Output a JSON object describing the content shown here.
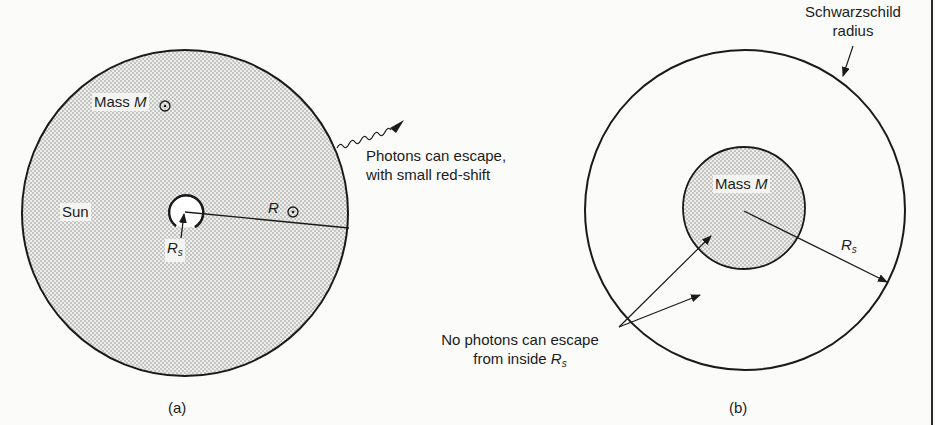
{
  "panel_a": {
    "caption": "(a)",
    "sun_label": "Sun",
    "mass_label": "Mass",
    "mass_symbol": "M",
    "radius_label": "R",
    "schwarzschild_label": "R",
    "schwarzschild_sub": "s",
    "photon_text_line1": "Photons can escape,",
    "photon_text_line2": "with small red-shift"
  },
  "panel_b": {
    "caption": "(b)",
    "mass_label": "Mass",
    "mass_symbol": "M",
    "radius_label": "R",
    "radius_sub": "s",
    "schwarzschild_line1": "Schwarzschild",
    "schwarzschild_line2": "radius",
    "no_escape_line1": "No photons can escape",
    "no_escape_line2_prefix": "from inside",
    "no_escape_symbol": "R",
    "no_escape_sub": "s"
  },
  "colors": {
    "stroke": "#1a1a1a",
    "stipple": "#9a9a9a",
    "fill": "#e9e9e6"
  }
}
